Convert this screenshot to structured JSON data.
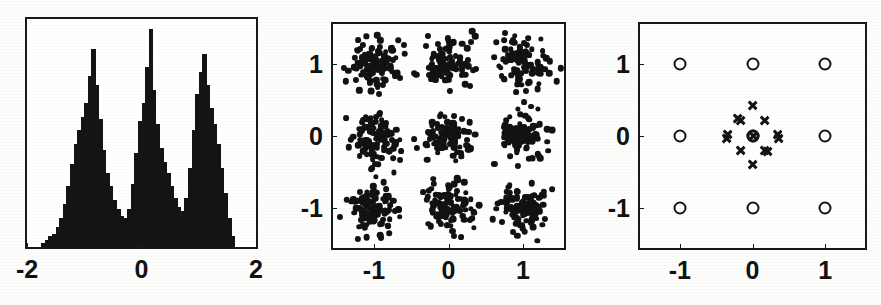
{
  "figure": {
    "name": "three-panel-clustering-figure",
    "background_color": "#fdfdfb",
    "ink_color": "#131416",
    "width": 881,
    "height": 305
  },
  "panels": [
    {
      "id": "panel-histogram",
      "label": "histogram-panel",
      "frame": {
        "left": 25,
        "top": 17,
        "width": 233,
        "height": 232
      },
      "axis": {
        "x_ticklabels": [
          "-2",
          "0",
          "2"
        ],
        "x_tickvalues": [
          -2,
          0,
          2
        ],
        "y_ticklabels": [],
        "y_tickvalues": []
      }
    },
    {
      "id": "panel-scatter",
      "label": "scatter-panel",
      "frame": {
        "left": 331,
        "top": 22,
        "width": 235,
        "height": 228
      },
      "axis": {
        "x_ticklabels": [
          "-1",
          "0",
          "1"
        ],
        "x_tickvalues": [
          -1,
          0,
          1
        ],
        "y_ticklabels": [
          "1",
          "0",
          "-1"
        ],
        "y_tickvalues": [
          1,
          0,
          -1
        ]
      }
    },
    {
      "id": "panel-centers",
      "label": "cluster-centers-panel",
      "frame": {
        "left": 638,
        "top": 22,
        "width": 229,
        "height": 228
      },
      "axis": {
        "x_ticklabels": [
          "-1",
          "0",
          "1"
        ],
        "x_tickvalues": [
          -1,
          0,
          1
        ],
        "y_ticklabels": [
          "1",
          "0",
          "-1"
        ],
        "y_tickvalues": [
          1,
          0,
          -1
        ]
      }
    }
  ],
  "chart_data": [
    {
      "type": "bar",
      "id": "panel-histogram",
      "title": "",
      "subtitle": "",
      "xlabel": "",
      "ylabel": "",
      "xlim": [
        -2,
        2
      ],
      "ylim": [
        0,
        100
      ],
      "grid": false,
      "legend": "none",
      "description": "Trimodal histogram of a one-dimensional projection; three Gaussian modes centred near -1, 0 and +1.",
      "bin_width": 0.0625,
      "bin_centers": [
        -1.71875,
        -1.65625,
        -1.59375,
        -1.53125,
        -1.46875,
        -1.40625,
        -1.34375,
        -1.28125,
        -1.21875,
        -1.15625,
        -1.09375,
        -1.03125,
        -0.96875,
        -0.90625,
        -0.84375,
        -0.78125,
        -0.71875,
        -0.65625,
        -0.59375,
        -0.53125,
        -0.46875,
        -0.40625,
        -0.34375,
        -0.28125,
        -0.21875,
        -0.15625,
        -0.09375,
        -0.03125,
        0.03125,
        0.09375,
        0.15625,
        0.21875,
        0.28125,
        0.34375,
        0.40625,
        0.46875,
        0.53125,
        0.59375,
        0.65625,
        0.71875,
        0.78125,
        0.84375,
        0.90625,
        0.96875,
        1.03125,
        1.09375,
        1.15625,
        1.21875,
        1.28125,
        1.34375,
        1.40625,
        1.46875,
        1.53125,
        1.59375
      ],
      "values": [
        2,
        3,
        5,
        6,
        9,
        13,
        19,
        27,
        37,
        46,
        52,
        58,
        64,
        76,
        88,
        72,
        57,
        43,
        33,
        27,
        21,
        17,
        14,
        13,
        17,
        28,
        42,
        56,
        64,
        80,
        97,
        70,
        55,
        44,
        38,
        33,
        27,
        22,
        18,
        16,
        22,
        35,
        52,
        68,
        78,
        86,
        72,
        62,
        55,
        46,
        35,
        24,
        13,
        5
      ]
    },
    {
      "type": "scatter",
      "id": "panel-scatter",
      "title": "",
      "xlabel": "",
      "ylabel": "",
      "xlim": [
        -1.55,
        1.55
      ],
      "ylim": [
        -1.55,
        1.55
      ],
      "grid": false,
      "legend": "none",
      "marker": "filled-circle",
      "marker_size_px": 6,
      "n_points": 900,
      "description": "Two-dimensional sample drawn from a mixture of nine isotropic Gaussians whose means form a 3x3 lattice at x,y in {-1, 0, 1}; 100 points per component with standard deviation about 0.17.",
      "clusters": [
        {
          "center": [
            -1,
            1
          ],
          "n": 100,
          "sigma": 0.17
        },
        {
          "center": [
            0,
            1
          ],
          "n": 100,
          "sigma": 0.17
        },
        {
          "center": [
            1,
            1
          ],
          "n": 100,
          "sigma": 0.17
        },
        {
          "center": [
            -1,
            0
          ],
          "n": 100,
          "sigma": 0.17
        },
        {
          "center": [
            0,
            0
          ],
          "n": 100,
          "sigma": 0.17
        },
        {
          "center": [
            1,
            0
          ],
          "n": 100,
          "sigma": 0.17
        },
        {
          "center": [
            -1,
            -1
          ],
          "n": 100,
          "sigma": 0.17
        },
        {
          "center": [
            0,
            -1
          ],
          "n": 100,
          "sigma": 0.17
        },
        {
          "center": [
            1,
            -1
          ],
          "n": 100,
          "sigma": 0.17
        }
      ]
    },
    {
      "type": "scatter",
      "id": "panel-centers",
      "title": "",
      "xlabel": "",
      "ylabel": "",
      "xlim": [
        -1.55,
        1.55
      ],
      "ylim": [
        -1.55,
        1.55
      ],
      "grid": false,
      "legend": "none",
      "description": "Recovered component means (open circles) on the 3x3 lattice, together with a diamond-shaped constellation of cross markers clustered tightly around the origin and a circled cross at the exact centre.",
      "series": [
        {
          "name": "component-centres",
          "marker": "open-circle",
          "marker_size_px": 13,
          "points": [
            [
              -1,
              1
            ],
            [
              0,
              1
            ],
            [
              1,
              1
            ],
            [
              -1,
              0
            ],
            [
              0,
              0
            ],
            [
              1,
              0
            ],
            [
              -1,
              -1
            ],
            [
              0,
              -1
            ],
            [
              1,
              -1
            ]
          ]
        },
        {
          "name": "origin-cross-constellation",
          "marker": "cross",
          "marker_size_px": 11,
          "points": [
            [
              0.0,
              0.42
            ],
            [
              -0.17,
              0.22
            ],
            [
              0.17,
              0.22
            ],
            [
              -0.34,
              0.02
            ],
            [
              0.34,
              0.02
            ],
            [
              -0.36,
              -0.04
            ],
            [
              0.36,
              -0.04
            ],
            [
              -0.17,
              -0.2
            ],
            [
              0.17,
              -0.2
            ],
            [
              0.0,
              -0.4
            ],
            [
              -0.2,
              0.24
            ],
            [
              0.2,
              -0.22
            ]
          ]
        },
        {
          "name": "origin-marker",
          "marker": "circled-cross",
          "marker_size_px": 13,
          "points": [
            [
              0,
              0
            ]
          ]
        }
      ]
    }
  ]
}
